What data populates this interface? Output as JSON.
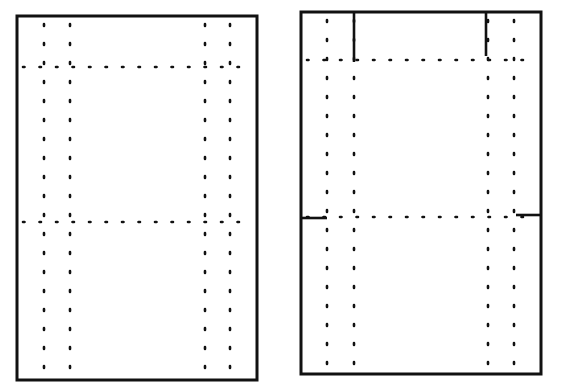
{
  "diagram": {
    "colors": {
      "ink": "#111111",
      "background": "#ffffff"
    },
    "panels": [
      {
        "id": "left",
        "rect": {
          "x1": 17,
          "y1": 16,
          "x2": 257,
          "y2": 380
        },
        "dotted_vertical_x": [
          44,
          70,
          205,
          230
        ],
        "dotted_horizontal_y": [
          67,
          222
        ],
        "solid_marks": []
      },
      {
        "id": "right",
        "rect": {
          "x1": 301,
          "y1": 12,
          "x2": 541,
          "y2": 374
        },
        "dotted_vertical_x": [
          327,
          354,
          488,
          514
        ],
        "dotted_horizontal_y": [
          60,
          217
        ],
        "solid_marks": [
          {
            "x1": 354,
            "y1": 12,
            "x2": 354,
            "y2": 62
          },
          {
            "x1": 486,
            "y1": 12,
            "x2": 486,
            "y2": 56
          },
          {
            "x1": 301,
            "y1": 218,
            "x2": 327,
            "y2": 218
          },
          {
            "x1": 516,
            "y1": 215,
            "x2": 541,
            "y2": 215
          }
        ]
      }
    ]
  }
}
